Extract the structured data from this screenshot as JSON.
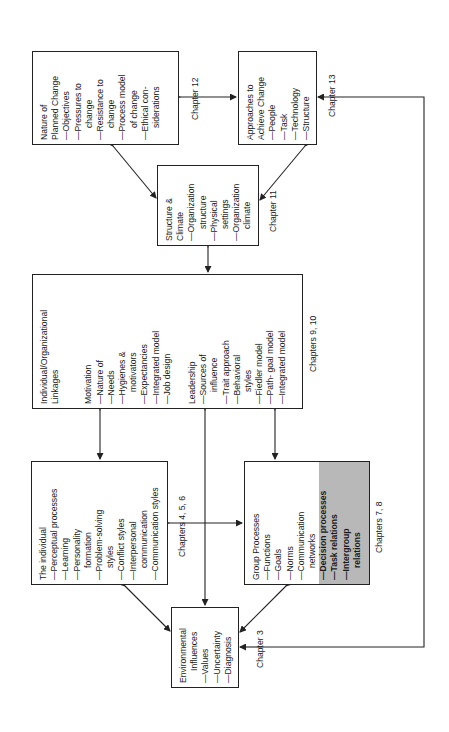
{
  "diagram": {
    "boxes": {
      "nature": {
        "title": [
          "Nature of",
          "Planned Change"
        ],
        "items": [
          {
            "text": "—Objectives",
            "indent": false
          },
          {
            "text": "—Pressures to",
            "indent": false
          },
          {
            "text": "change",
            "indent": true
          },
          {
            "text": "—Resistance to",
            "indent": false
          },
          {
            "text": "change",
            "indent": true
          },
          {
            "text": "—Process model",
            "indent": false
          },
          {
            "text": "of change",
            "indent": true
          },
          {
            "text": "—Ethical con-",
            "indent": false
          },
          {
            "text": "siderations",
            "indent": true
          }
        ]
      },
      "approaches": {
        "title": [
          "Approaches to",
          "Achieve Change"
        ],
        "items": [
          {
            "text": "—People",
            "indent": false
          },
          {
            "text": "—Task",
            "indent": false
          },
          {
            "text": "—Technology",
            "indent": false
          },
          {
            "text": "—Structure",
            "indent": false
          }
        ]
      },
      "structure": {
        "title": [
          "Structure &",
          "Climate"
        ],
        "items": [
          {
            "text": "—Organization",
            "indent": false
          },
          {
            "text": "structure",
            "indent": true
          },
          {
            "text": "—Physical",
            "indent": false
          },
          {
            "text": "settings",
            "indent": true
          },
          {
            "text": "—Organization",
            "indent": false
          },
          {
            "text": "climate",
            "indent": true
          }
        ]
      },
      "linkages": {
        "title": [
          "Individual/Organizational",
          "Linkages"
        ],
        "motivation": {
          "heading": "Motivation",
          "items": [
            {
              "text": "—Nature of",
              "indent": false
            },
            {
              "text": "—Needs",
              "indent": false
            },
            {
              "text": "—Hygienes &",
              "indent": false
            },
            {
              "text": "motivators",
              "indent": true
            },
            {
              "text": "—Expectancies",
              "indent": false
            },
            {
              "text": "—Integrated model",
              "indent": false
            },
            {
              "text": "—Job design",
              "indent": false
            }
          ]
        },
        "leadership": {
          "heading": "Leadership",
          "items": [
            {
              "text": "—Sources of",
              "indent": false
            },
            {
              "text": "influence",
              "indent": true
            },
            {
              "text": "—Trait approach",
              "indent": false
            },
            {
              "text": "—Behavioral",
              "indent": false
            },
            {
              "text": "styles",
              "indent": true
            },
            {
              "text": "—Fiedler model",
              "indent": false
            },
            {
              "text": "—Path- goal model",
              "indent": false
            },
            {
              "text": "—Integrated model",
              "indent": false
            }
          ]
        }
      },
      "individual": {
        "title": [
          "The individual"
        ],
        "items": [
          {
            "text": "—Perceptual processes",
            "indent": false
          },
          {
            "text": "—Learning",
            "indent": false
          },
          {
            "text": "—Personality",
            "indent": false
          },
          {
            "text": "formation",
            "indent": true
          },
          {
            "text": "—Problem-solving",
            "indent": false
          },
          {
            "text": "styles",
            "indent": true
          },
          {
            "text": "—Conflict styles",
            "indent": false
          },
          {
            "text": "—Interpersonal",
            "indent": false
          },
          {
            "text": "communication",
            "indent": true
          },
          {
            "text": "—Communication styles",
            "indent": false
          }
        ]
      },
      "group": {
        "title": [
          "Group Processes"
        ],
        "items": [
          {
            "text": "—Functions",
            "indent": false
          },
          {
            "text": "—Goals",
            "indent": false
          },
          {
            "text": "—Norms",
            "indent": false
          },
          {
            "text": "—Communication",
            "indent": false
          },
          {
            "text": "networks",
            "indent": true
          }
        ],
        "shaded_items": [
          {
            "text": "—Decision processes",
            "indent": false
          },
          {
            "text": "—Task relations",
            "indent": false
          },
          {
            "text": "—Intergroup",
            "indent": false
          },
          {
            "text": "relations",
            "indent": true
          }
        ],
        "shade_color": "#b8b8b8"
      },
      "environmental": {
        "title": [
          "Environmental",
          "Influences"
        ],
        "items": [
          {
            "text": "—Values",
            "indent": false
          },
          {
            "text": "—Uncertainty",
            "indent": false
          },
          {
            "text": "—Diagnosis",
            "indent": false
          }
        ]
      }
    },
    "chapter_labels": {
      "ch12": "Chapter 12",
      "ch13": "Chapter 13",
      "ch11": "Chapter 11",
      "ch9_10": "Chapters 9, 10",
      "ch4_5_6": "Chapters 4, 5, 6",
      "ch7_8": "Chapters 7, 8",
      "ch3": "Chapter 3"
    },
    "colors": {
      "line": "#222222",
      "background": "#ffffff",
      "shade": "#b8b8b8"
    }
  }
}
